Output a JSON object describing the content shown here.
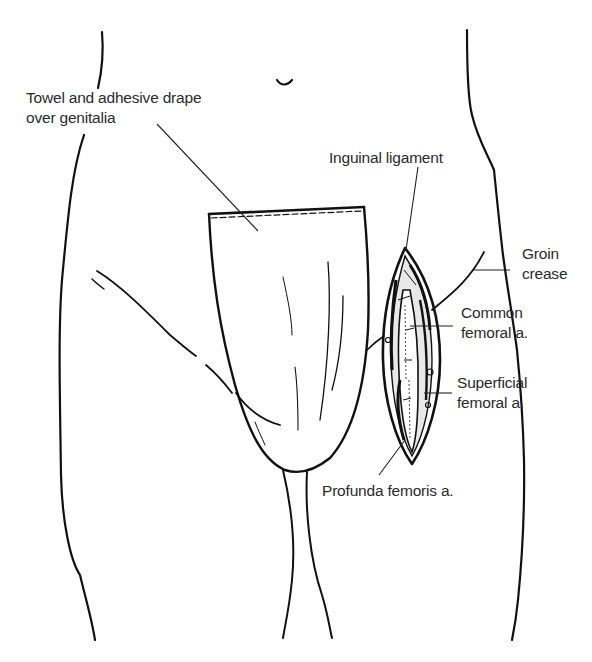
{
  "figure": {
    "type": "anatomical-line-illustration",
    "colors": {
      "background": "#ffffff",
      "ink": "#111111",
      "label_text": "#2a2a2a"
    }
  },
  "labels": {
    "drape": {
      "line1": "Towel and adhesive drape",
      "line2": "over genitalia"
    },
    "inguinal": {
      "line1": "Inguinal ligament"
    },
    "groin": {
      "line1": "Groin",
      "line2": "crease"
    },
    "common_femoral": {
      "line1": "Common",
      "line2": "femoral a."
    },
    "superficial_femoral": {
      "line1": "Superficial",
      "line2": "femoral a."
    },
    "profunda": {
      "line1": "Profunda femoris a."
    }
  }
}
